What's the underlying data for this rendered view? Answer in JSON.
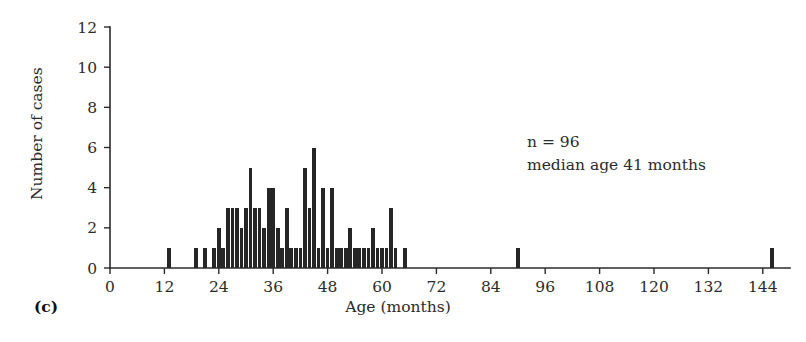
{
  "figure": {
    "panel_label": "(c)",
    "annotations": [
      "n = 96",
      "median age 41 months"
    ]
  },
  "chart_data": {
    "type": "bar",
    "title": "",
    "subtitle": "",
    "xlabel": "Age (months)",
    "ylabel": "Number of cases",
    "xlim": [
      0,
      150
    ],
    "ylim": [
      0,
      12
    ],
    "grid": false,
    "legend": null,
    "bar_color": "#262626",
    "bin_width_months": 1,
    "xticks": [
      0,
      12,
      24,
      36,
      48,
      60,
      72,
      84,
      96,
      108,
      120,
      132,
      144
    ],
    "xtick_labels": [
      "0",
      "12",
      "24",
      "36",
      "48",
      "60",
      "72",
      "84",
      "96",
      "108",
      "120",
      "132",
      "144"
    ],
    "yticks": [
      0,
      2,
      4,
      6,
      8,
      10,
      12
    ],
    "ytick_labels": [
      "0",
      "2",
      "4",
      "6",
      "8",
      "10",
      "12"
    ],
    "annotations": [
      {
        "text": "n = 96",
        "x": 105,
        "y": 6.6
      },
      {
        "text": "median age 41 months",
        "x": 105,
        "y": 5.7
      }
    ],
    "categories": [
      13,
      19,
      21,
      23,
      24,
      25,
      26,
      27,
      28,
      29,
      30,
      31,
      32,
      33,
      34,
      35,
      36,
      37,
      38,
      39,
      40,
      41,
      42,
      43,
      44,
      45,
      46,
      47,
      48,
      49,
      50,
      51,
      52,
      53,
      54,
      55,
      56,
      57,
      58,
      59,
      60,
      61,
      62,
      63,
      65,
      90,
      146
    ],
    "values": [
      1,
      1,
      1,
      1,
      2,
      1,
      3,
      3,
      3,
      2,
      3,
      5,
      3,
      3,
      2,
      4,
      4,
      2,
      1,
      3,
      1,
      1,
      1,
      5,
      3,
      6,
      1,
      4,
      1,
      4,
      1,
      1,
      1,
      2,
      1,
      1,
      1,
      1,
      2,
      1,
      1,
      1,
      3,
      1,
      1,
      1,
      1
    ],
    "series": [
      {
        "name": "Number of cases",
        "values": [
          1,
          1,
          1,
          1,
          2,
          1,
          3,
          3,
          3,
          2,
          3,
          5,
          3,
          3,
          2,
          4,
          4,
          2,
          1,
          3,
          1,
          1,
          1,
          5,
          3,
          6,
          1,
          4,
          1,
          4,
          1,
          1,
          1,
          2,
          1,
          1,
          1,
          1,
          2,
          1,
          1,
          1,
          3,
          1,
          1,
          1,
          1
        ]
      }
    ]
  }
}
